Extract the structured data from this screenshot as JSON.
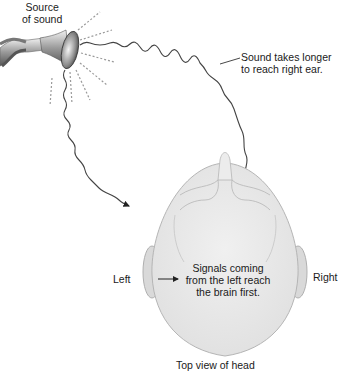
{
  "labels": {
    "source": [
      "Source",
      "of sound"
    ],
    "right_ear_delay": [
      "Sound takes longer",
      "to reach right ear."
    ],
    "signal": [
      "Signals coming",
      "from the left reach",
      "the brain first."
    ],
    "left": "Left",
    "right": "Right",
    "caption": "Top view of head"
  },
  "colors": {
    "head_fill": "#e9e9e9",
    "head_stroke": "#b5b5b5",
    "wave_stroke": "#444444",
    "dash_stroke": "#9a9a9a"
  }
}
